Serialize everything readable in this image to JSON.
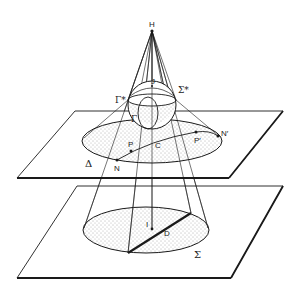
{
  "diagram": {
    "title": "",
    "labels": {
      "H": "H",
      "J": "J",
      "gamma_star": "Γ*",
      "sigma_star": "Σ*",
      "gamma": "Γ",
      "P": "P",
      "P_prime": "P′",
      "N": "N",
      "N_prime": "N′",
      "C": "C",
      "delta": "Δ",
      "I": "I",
      "D": "D",
      "sigma": "Σ"
    },
    "colors": {
      "line": "#1a1a1a",
      "fill_dots": "#555555",
      "background": "#ffffff"
    }
  }
}
